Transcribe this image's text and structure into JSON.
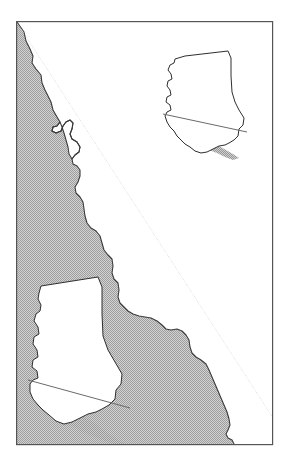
{
  "figure": {
    "kind": "map",
    "title": "",
    "caption": "",
    "width": 285,
    "height": 471,
    "background_color": "#ffffff"
  },
  "frame": {
    "name": "map-neatline",
    "x": 16,
    "y": 21,
    "width": 257,
    "height": 424,
    "stroke_color": "#555555",
    "stroke_width": 1.2,
    "fill_color": "#ffffff"
  },
  "styles": {
    "land_shading_color": "#b9b9b9",
    "land_shading_color_light": "#c9c9c9",
    "coastline_color": "#3a3a3a",
    "coastline_width": 1.1,
    "inset_outline_color": "#2f2f2f",
    "inset_outline_width": 1.0,
    "inset_fill_color": "#ffffff",
    "inset_shading_color": "#b0b0b0",
    "ocean_color": "#ffffff"
  },
  "layers": [
    {
      "name": "coastal-land-shading",
      "label": "Shaded coastal land mass (southwest of coastline)",
      "fill": "#b9b9b9",
      "stroke": "#3a3a3a"
    },
    {
      "name": "pacific-ocean",
      "label": "Pacific Ocean (unshaded)",
      "fill": "#ffffff",
      "stroke": "none"
    },
    {
      "name": "california-inset-small",
      "label": "California locator inset (small, upper right)",
      "fill": "#ffffff",
      "stroke": "#2f2f2f"
    },
    {
      "name": "california-inset-large",
      "label": "California locator inset (large, lower left)",
      "fill": "#ffffff",
      "stroke": "#2f2f2f"
    }
  ],
  "geometry": {
    "main_coastline_path": "M 17,22 L 24,32 L 26,41 L 30,49 L 33,56 L 32,63 L 36,69 L 41,75 L 42,83 L 45,90 L 48,96 L 51,102 L 53,110 L 57,117 L 60,122 L 57,126 L 53,127 L 52,131 L 56,133 L 61,131 L 63,126 L 66,122 L 70,120 L 73,123 L 72,129 L 70,134 L 72,139 L 77,142 L 80,147 L 79,152 L 75,155 L 72,159 L 73,164 L 77,166 L 80,170 L 80,176 L 78,182 L 75,187 L 76,193 L 80,197 L 83,202 L 84,209 L 85,216 L 87,223 L 91,228 L 96,231 L 100,236 L 102,243 L 104,250 L 108,255 L 112,259 L 113,266 L 112,273 L 114,279 L 118,283 L 119,290 L 118,297 L 120,303 L 124,307 L 128,311 L 133,314 L 139,316 L 145,317 L 151,318 L 157,321 L 162,325 L 166,329 L 171,330 L 177,329 L 182,331 L 186,335 L 189,340 L 190,347 L 192,353 L 196,357 L 201,360 L 206,364 L 209,370 L 212,377 L 215,384 L 218,391 L 221,398 L 224,405 L 227,412 L 229,419 L 230,425 L 228,430 L 226,434 L 228,438 L 232,440 L 234,444",
    "shading_outer_edge_path": "M 17,22 L 272,416 L 272,444",
    "inset_small": {
      "x": 155,
      "y": 40,
      "width": 100,
      "height": 130,
      "outline_path": "M 30,16 L 73,11 L 76,18 L 76,36 L 77,52 L 80,62 L 84,70 L 89,78 L 88,85 L 84,89 L 83,96 L 79,100 L 74,103 L 70,105 L 64,106 L 58,109 L 52,112 L 46,113 L 40,111 L 35,107 L 30,104 L 26,100 L 22,96 L 19,91 L 15,87 L 12,82 L 10,76 L 12,72 L 16,70 L 15,65 L 11,62 L 12,57 L 16,55 L 15,50 L 12,46 L 13,41 L 17,39 L 16,34 L 13,30 L 15,25 L 19,23 L 20,19 Z",
      "shading_path": "M 10,76 L 12,72 L 16,70 L 18,73 L 22,77 L 26,81 L 30,85 L 35,89 L 40,92 L 45,95 L 50,97 L 56,99 L 62,101 L 68,102 L 74,103 L 70,105 L 64,106 L 58,109 L 52,112 L 46,113 L 40,111 L 35,107 L 30,104 L 26,100 L 22,96 L 19,91 L 15,87 L 12,82 Z",
      "shadow_line_path": "M 8,74 L 92,92"
    },
    "inset_large": {
      "x": 30,
      "y": 268,
      "width": 135,
      "height": 170,
      "outline_path": "M 11,18 L 68,9 L 72,19 L 72,46 L 73,68 L 78,82 L 85,94 L 92,106 L 91,116 L 86,122 L 85,131 L 79,137 L 72,141 L 66,144 L 58,146 L 50,150 L 42,154 L 34,156 L 26,153 L 19,147 L 13,142 L 8,137 L 3,131 L 0,124 L 0,116 L 3,112 L 8,110 L 7,103 L 2,99 L 3,92 L 8,89 L 7,82 L 3,76 L 4,69 L 9,66 L 8,59 L 4,53 L 6,46 L 10,43 L 11,37 L 8,31 L 9,25 Z",
      "shading_path": "M 0,116 L 3,112 L 8,110 L 12,115 L 17,121 L 23,127 L 29,132 L 36,137 L 43,141 L 50,144 L 58,146 L 50,150 L 42,154 L 34,156 L 26,153 L 19,147 L 13,142 L 8,137 L 3,131 L 0,124 Z",
      "shadow_line_path": "M -2,112 L 100,140"
    }
  },
  "annotations": []
}
